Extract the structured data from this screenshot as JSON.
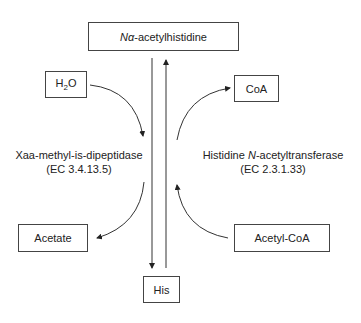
{
  "nodes": {
    "top": {
      "prefix": "Nα",
      "suffix": "-acetylhistidine"
    },
    "water": {
      "pre": "H",
      "sub": "2",
      "post": "O"
    },
    "coa": "CoA",
    "acetate": "Acetate",
    "acetylcoa": "Acetyl-CoA",
    "his": "His"
  },
  "enzymes": {
    "left": {
      "name": "Xaa-methyl-is-dipeptidase",
      "ec": "(EC 3.4.13.5)"
    },
    "right": {
      "name_pre": "Histidine ",
      "name_italic": "N",
      "name_post": "-acetyltransferase",
      "ec": "(EC 2.3.1.33)"
    }
  }
}
